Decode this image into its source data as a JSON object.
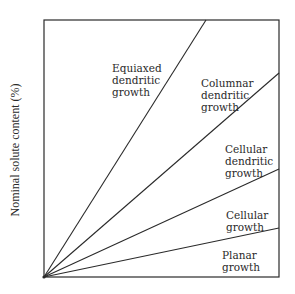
{
  "chart_data": {
    "type": "line",
    "title": "",
    "xlabel": "",
    "ylabel": "Nominal solute content (%)",
    "grid": false,
    "legend": "none",
    "frame": {
      "left": 44,
      "top": 20,
      "right": 279,
      "bottom": 277
    },
    "boundaries": [
      {
        "name": "equiaxed-columnar",
        "from": [
          44,
          277
        ],
        "to": [
          206,
          20
        ]
      },
      {
        "name": "columnar-cellular-dendritic",
        "from": [
          44,
          277
        ],
        "to": [
          279,
          73
        ]
      },
      {
        "name": "cellular-dendritic-cellular",
        "from": [
          44,
          277
        ],
        "to": [
          279,
          169
        ]
      },
      {
        "name": "cellular-planar",
        "from": [
          44,
          277
        ],
        "to": [
          279,
          228
        ]
      }
    ],
    "regions": [
      {
        "id": "equiaxed",
        "lines": [
          "Equiaxed",
          "dendritic",
          "growth"
        ],
        "x": 112,
        "y": 64
      },
      {
        "id": "columnar",
        "lines": [
          "Columnar",
          "dendritic",
          "growth"
        ],
        "x": 201,
        "y": 79
      },
      {
        "id": "cellular-dendritic",
        "lines": [
          "Cellular",
          "dendritic",
          "growth"
        ],
        "x": 225,
        "y": 145
      },
      {
        "id": "cellular",
        "lines": [
          "Cellular",
          "growth"
        ],
        "x": 226,
        "y": 211
      },
      {
        "id": "planar",
        "lines": [
          "Planar",
          "growth"
        ],
        "x": 222,
        "y": 251
      }
    ]
  },
  "colors": {
    "background": "#ffffff",
    "ink": "#2a2a2a"
  }
}
